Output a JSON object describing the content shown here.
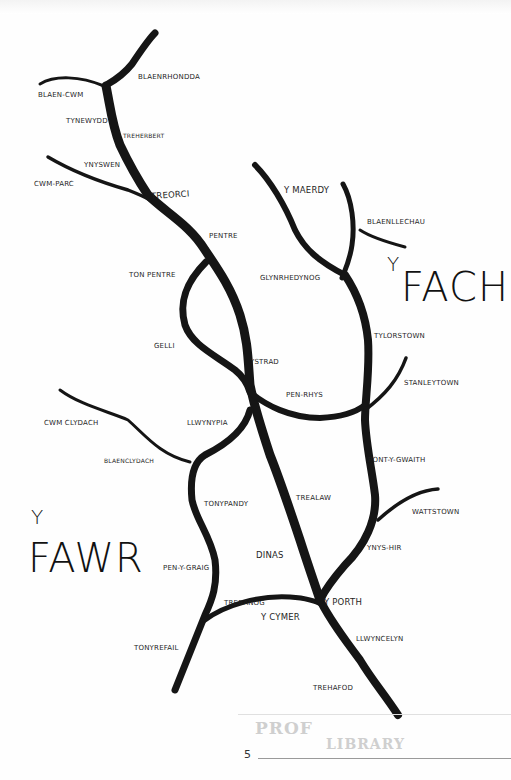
{
  "map": {
    "title_fach": {
      "y": "Y",
      "word": "FACH"
    },
    "title_fawr": {
      "y": "Y",
      "word": "FAWR"
    },
    "colors": {
      "river": "#151515",
      "ink": "#1e1e1e",
      "paper": "#fefefe",
      "stamp": "#cfcfcf"
    },
    "places": {
      "blaenrhondda": "Blaenrhondda",
      "blaen_cwm": "Blaen-Cwm",
      "tynewydd": "Tynewydd",
      "treherbert": "Treherbert",
      "ynyswen": "Ynyswen",
      "cwm_parc": "Cwm-Parc",
      "treorci": "Treorci",
      "pentre": "Pentre",
      "ton_pentre": "Ton Pentre",
      "gelli": "Gelli",
      "ystrad": "Ystrad",
      "pen_rhys": "Pen-Rhys",
      "llwynypia": "Llwynypia",
      "cwm_clydach": "Cwm Clydach",
      "blaenclydach": "Blaenclydach",
      "tonypandy": "Tonypandy",
      "trealaw": "Trealaw",
      "dinas": "Dinas",
      "pen_y_graig": "Pen-y-Graig",
      "trebanog": "Trebanog",
      "y_cymer": "Y Cymer",
      "y_porth": "Y Porth",
      "tonyrefail": "Tonyrefail",
      "llwyncelyn": "Llwyncelyn",
      "trehafod": "Trehafod",
      "y_maerdy": "Y Maerdy",
      "blaenllechau": "Blaenllechau",
      "glynrhedynog": "Glynrhedynog",
      "tylorstown": "Tylorstown",
      "stanleytown": "Stanleytown",
      "pont_y_gwaith": "Pont-y-Gwaith",
      "wattstown": "Wattstown",
      "ynys_hir": "Ynys-Hir"
    }
  },
  "footer": {
    "page_number": "5",
    "stamp_line1": "PROF",
    "stamp_line2": "LIBRARY"
  }
}
